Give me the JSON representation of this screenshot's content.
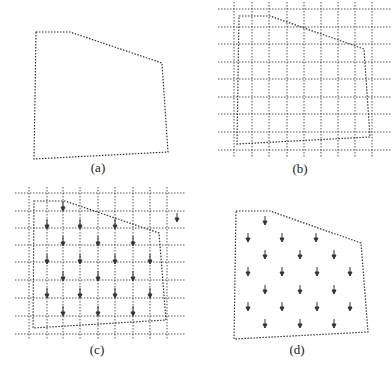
{
  "panels": [
    {
      "id": "a",
      "label": "(a)",
      "grid": false,
      "arrows": false
    },
    {
      "id": "b",
      "label": "(b)",
      "grid": true,
      "arrows": false
    },
    {
      "id": "c",
      "label": "(c)",
      "grid": true,
      "arrows": true
    },
    {
      "id": "d",
      "label": "(d)",
      "grid": false,
      "arrows": true
    }
  ],
  "colors": {
    "line": "#333333",
    "grid": "#555555",
    "background": "#ffffff"
  }
}
